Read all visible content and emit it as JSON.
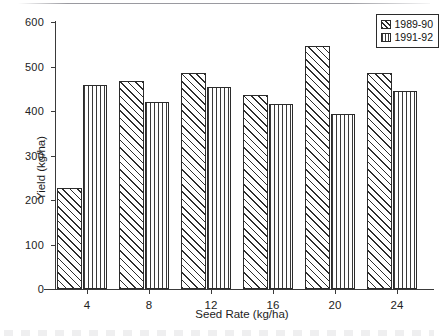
{
  "chart_data": {
    "type": "bar",
    "title": "",
    "subtitle": "",
    "xlabel": "Seed Rate (kg/ha)",
    "ylabel": "Yield (kg/ha)",
    "categories": [
      "4",
      "8",
      "12",
      "16",
      "20",
      "24"
    ],
    "series": [
      {
        "name": "1989-90",
        "values": [
          227,
          467,
          486,
          437,
          547,
          486
        ],
        "pattern": "diagonal-hatch"
      },
      {
        "name": "1991-92",
        "values": [
          458,
          420,
          455,
          415,
          393,
          446
        ],
        "pattern": "vertical-lines"
      }
    ],
    "ylim": [
      0,
      600
    ],
    "yticks": [
      0,
      100,
      200,
      300,
      400,
      500,
      600
    ],
    "ytick_labels": [
      "0",
      "100",
      "200",
      "300",
      "400",
      "500",
      "600"
    ],
    "xtick_labels": [
      "4",
      "8",
      "12",
      "16",
      "20",
      "24"
    ],
    "grid": false,
    "legend_position": "top-right",
    "legend_entries": [
      "1989-90",
      "1991-92"
    ],
    "spines": [
      "left",
      "bottom"
    ],
    "annotations": []
  },
  "figure": {
    "axis_color": "#3a3a3a",
    "bar_edge_color": "#2b2b2b",
    "background": "#ffffff"
  }
}
